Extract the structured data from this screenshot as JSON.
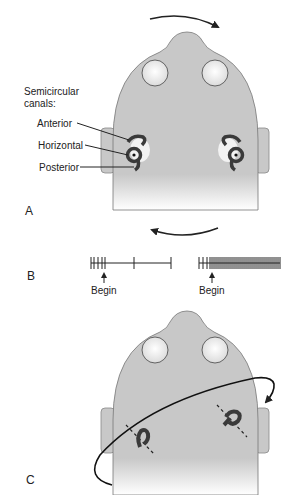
{
  "panels": {
    "a": {
      "label": "A",
      "title_line1": "Semicircular",
      "title_line2": "canals:",
      "canal_labels": [
        "Anterior",
        "Horizontal",
        "Posterior"
      ],
      "rotation": "head rotation to the right (clockwise arrow above, counter arrow below)"
    },
    "b": {
      "label": "B",
      "left_train": {
        "begin_label": "Begin",
        "description": "firing rate decreases after begin"
      },
      "right_train": {
        "begin_label": "Begin",
        "description": "firing rate increases after begin"
      }
    },
    "c": {
      "label": "C",
      "description": "tilted plane of rotation aligned with canals"
    }
  },
  "colors": {
    "head_fill": "#c8c8c8",
    "outline": "#555555",
    "canal": "#3a3a3a",
    "eye_fill": "#f0f0f0",
    "background": "#ffffff"
  }
}
